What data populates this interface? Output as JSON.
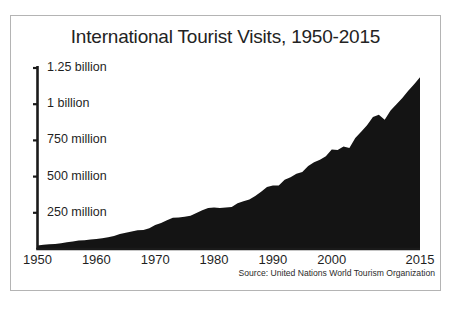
{
  "figure": {
    "title": "International Tourist Visits, 1950-2015",
    "source_note": "Source: United Nations World Tourism Organization",
    "frame_color": "#b4b4b4",
    "area_color": "#141414",
    "axis_color": "#1a1a1a",
    "background": "#ffffff"
  },
  "chart_data": {
    "type": "area",
    "title": "International Tourist Visits, 1950-2015",
    "subtitle": "",
    "xlabel": "",
    "ylabel": "",
    "source": "Source: United Nations World Tourism Organization",
    "grid": false,
    "legend": "none",
    "xlim": [
      1950,
      2015
    ],
    "ylim": [
      0,
      1250000000
    ],
    "y_tick_values": [
      250000000,
      500000000,
      750000000,
      1000000000,
      1250000000
    ],
    "y_tick_labels": [
      "250 million",
      "500 million",
      "750 million",
      "1 billion",
      "1.25 billion"
    ],
    "x_tick_values": [
      1950,
      1960,
      1970,
      1980,
      1990,
      2000,
      2015
    ],
    "x_tick_labels": [
      "1950",
      "1960",
      "1970",
      "1980",
      "1990",
      "2000",
      "2015"
    ],
    "units": "international tourist arrivals",
    "x": [
      1950,
      1951,
      1952,
      1953,
      1954,
      1955,
      1956,
      1957,
      1958,
      1959,
      1960,
      1961,
      1962,
      1963,
      1964,
      1965,
      1966,
      1967,
      1968,
      1969,
      1970,
      1971,
      1972,
      1973,
      1974,
      1975,
      1976,
      1977,
      1978,
      1979,
      1980,
      1981,
      1982,
      1983,
      1984,
      1985,
      1986,
      1987,
      1988,
      1989,
      1990,
      1991,
      1992,
      1993,
      1994,
      1995,
      1996,
      1997,
      1998,
      1999,
      2000,
      2001,
      2002,
      2003,
      2004,
      2005,
      2006,
      2007,
      2008,
      2009,
      2010,
      2011,
      2012,
      2013,
      2014,
      2015
    ],
    "values": [
      25000000,
      29000000,
      32000000,
      35000000,
      40000000,
      46000000,
      52000000,
      58000000,
      61000000,
      66000000,
      69000000,
      75000000,
      81000000,
      90000000,
      104000000,
      113000000,
      120000000,
      130000000,
      131000000,
      143000000,
      166000000,
      179000000,
      198000000,
      215000000,
      218000000,
      222000000,
      229000000,
      249000000,
      267000000,
      283000000,
      286000000,
      284000000,
      287000000,
      290000000,
      316000000,
      329000000,
      341000000,
      366000000,
      395000000,
      428000000,
      439000000,
      439000000,
      479000000,
      495000000,
      519000000,
      532000000,
      573000000,
      599000000,
      617000000,
      640000000,
      687000000,
      684000000,
      708000000,
      697000000,
      766000000,
      809000000,
      855000000,
      911000000,
      928000000,
      892000000,
      956000000,
      1000000000,
      1042000000,
      1093000000,
      1138000000,
      1186000000
    ],
    "annotations": [
      "Steady growth 1950-1980",
      "Plateau 1980-1983",
      "Dip around 2001-2003",
      "Dip in 2009",
      "Peak ~1.186 billion in 2015"
    ]
  }
}
